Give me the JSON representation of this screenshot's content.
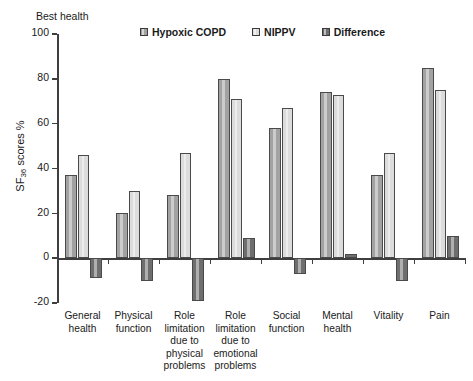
{
  "annotations": {
    "best_health": "Best health",
    "y_axis_title_main": "SF",
    "y_axis_title_sub": "36",
    "y_axis_title_tail": " scores %"
  },
  "legend": {
    "items": [
      {
        "label": "Hypoxic COPD",
        "color": "#a2a2a2"
      },
      {
        "label": "NIPPV",
        "color": "#dcdcdc"
      },
      {
        "label": "Difference",
        "color": "#6e6e6e"
      }
    ]
  },
  "chart_data": {
    "type": "bar",
    "title": "",
    "xlabel": "",
    "ylabel": "SF36 scores %",
    "ylim": [
      -20,
      100
    ],
    "yticks": [
      -20,
      0,
      20,
      40,
      60,
      80,
      100
    ],
    "ytick_labels": [
      "-20",
      "0",
      "20",
      "40",
      "60",
      "80",
      "100"
    ],
    "grid": false,
    "legend_position": "top",
    "categories": [
      "General health",
      "Physical function",
      "Role limitation due to physical problems",
      "Role limitation due to emotional problems",
      "Social function",
      "Mental health",
      "Vitality",
      "Pain"
    ],
    "category_lines": [
      [
        "General",
        "health"
      ],
      [
        "Physical",
        "function"
      ],
      [
        "Role",
        "limitation",
        "due to",
        "physical",
        "problems"
      ],
      [
        "Role",
        "limitation",
        "due to",
        "emotional",
        "problems"
      ],
      [
        "Social",
        "function"
      ],
      [
        "Mental",
        "health"
      ],
      [
        "Vitality"
      ],
      [
        "Pain"
      ]
    ],
    "series": [
      {
        "name": "Hypoxic COPD",
        "color": "#a2a2a2",
        "values": [
          37,
          20,
          28,
          80,
          58,
          74,
          37,
          85
        ]
      },
      {
        "name": "NIPPV",
        "color": "#dcdcdc",
        "values": [
          46,
          30,
          47,
          71,
          67,
          73,
          47,
          75
        ]
      },
      {
        "name": "Difference",
        "color": "#6e6e6e",
        "values": [
          -9,
          -10,
          -19,
          9,
          -7,
          2,
          -10,
          10
        ]
      }
    ]
  }
}
